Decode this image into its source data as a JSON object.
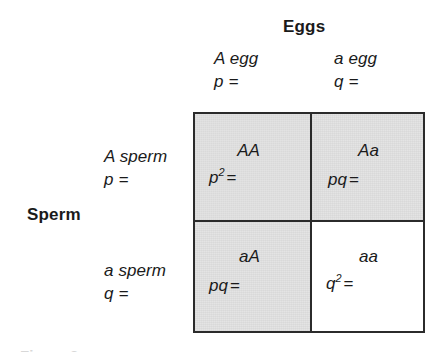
{
  "figure": {
    "kind": "punnett-square",
    "column_axis_title": "Eggs",
    "row_axis_title": "Sperm",
    "shaded_color": "#e2e2e2",
    "border_color": "#2b2b2b",
    "caption_sliver": "Figure 2"
  },
  "columns": [
    {
      "gamete": "A egg",
      "frequency": "p ="
    },
    {
      "gamete": "a egg",
      "frequency": "q ="
    }
  ],
  "rows": [
    {
      "gamete": "A sperm",
      "frequency": "p ="
    },
    {
      "gamete": "a sperm",
      "frequency": "q ="
    }
  ],
  "cells": [
    {
      "id": "AA",
      "genotype": "AA",
      "freq_base": "p",
      "freq_sup": "2",
      "freq_eq": "=",
      "shaded": true
    },
    {
      "id": "Aa",
      "genotype": "Aa",
      "freq_base": "pq",
      "freq_sup": "",
      "freq_eq": "=",
      "shaded": true
    },
    {
      "id": "aA",
      "genotype": "aA",
      "freq_base": "pq",
      "freq_sup": "",
      "freq_eq": "=",
      "shaded": true
    },
    {
      "id": "aa",
      "genotype": "aa",
      "freq_base": "q",
      "freq_sup": "2",
      "freq_eq": "=",
      "shaded": false
    }
  ]
}
